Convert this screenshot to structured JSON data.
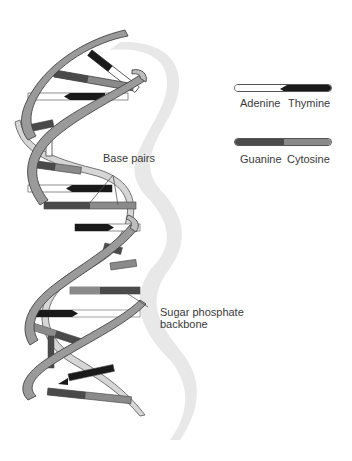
{
  "diagram": {
    "labels": {
      "base_pairs": "Base pairs",
      "backbone_line1": "Sugar phosphate",
      "backbone_line2": "backbone"
    },
    "legend": [
      {
        "left": {
          "name": "Adenine",
          "color": "#ffffff"
        },
        "right": {
          "name": "Thymine",
          "color": "#1a1a1a"
        }
      },
      {
        "left": {
          "name": "Guanine",
          "color": "#4a4a4a"
        },
        "right": {
          "name": "Cytosine",
          "color": "#8a8a8a"
        }
      }
    ],
    "colors": {
      "backbone": "#9a9a9a",
      "backbone_inner": "#d8d8d8",
      "shadow": "#e6e6e6",
      "outline": "#444444"
    }
  }
}
